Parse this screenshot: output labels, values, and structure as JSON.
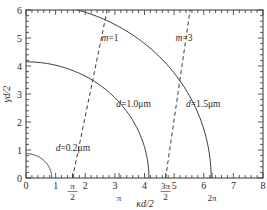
{
  "chart_data": {
    "type": "line",
    "title": "",
    "xlabel": "κd/2",
    "ylabel": "γd/2",
    "xlim": [
      0,
      8
    ],
    "ylim": [
      0,
      6
    ],
    "grid": false,
    "legend": "none (inline curve labels)",
    "x_ticks": [
      0,
      1,
      2,
      3,
      4,
      5,
      6,
      7,
      8
    ],
    "y_ticks": [
      0,
      1,
      2,
      3,
      4,
      5,
      6
    ],
    "special_x_ticks": [
      {
        "value": 1.5708,
        "label_num": "π",
        "label_den": "2"
      },
      {
        "value": 3.1416,
        "label_num": "",
        "label_den": "π"
      },
      {
        "value": 4.7124,
        "label_num": "3π",
        "label_den": "2"
      },
      {
        "value": 6.2832,
        "label_num": "",
        "label_den": "2π"
      }
    ],
    "series": [
      {
        "name": "d=0.2μm",
        "style": "solid",
        "kind": "circle",
        "radius": 0.87,
        "label": "d=0.2μm",
        "label_pos": [
          1.0,
          0.95
        ]
      },
      {
        "name": "d=1.0μm",
        "style": "solid",
        "kind": "circle",
        "radius": 4.15,
        "label": "d=1.0μm",
        "label_pos": [
          3.05,
          2.55
        ]
      },
      {
        "name": "d=1.5μm",
        "style": "solid",
        "kind": "circle",
        "radius": 6.25,
        "label": "d=1.5μm",
        "label_pos": [
          5.4,
          2.55
        ]
      },
      {
        "name": "m=1",
        "style": "dashed",
        "kind": "line",
        "points": [
          [
            1.5708,
            0
          ],
          [
            2.74,
            6
          ]
        ],
        "label": "m=1",
        "label_pos": [
          2.55,
          4.9
        ]
      },
      {
        "name": "m=3",
        "style": "dashed",
        "kind": "line",
        "points": [
          [
            4.7124,
            0
          ],
          [
            5.54,
            6
          ]
        ],
        "label": "m=3",
        "label_pos": [
          5.05,
          4.9
        ]
      }
    ]
  },
  "colors": {
    "axis": "#333333",
    "curve": "#3a3a3a",
    "background": "#ffffff"
  }
}
